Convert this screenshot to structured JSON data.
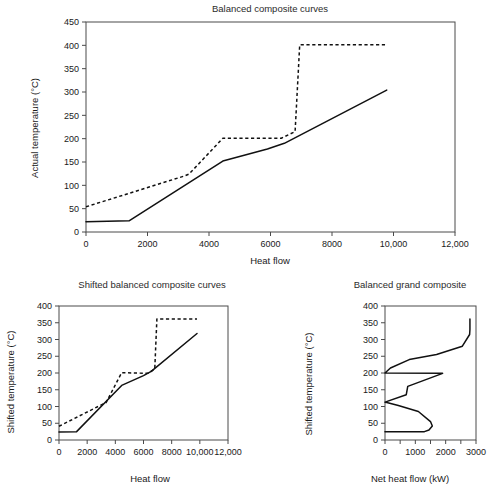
{
  "figure": {
    "background": "#ffffff",
    "line_color": "#111111",
    "axis_color": "#4a4a4a"
  },
  "chart_data": [
    {
      "id": "balanced-composite-curves",
      "type": "line",
      "title": "Balanced composite curves",
      "xlabel": "Heat flow",
      "ylabel": "Actual temperature (°C)",
      "xlim": [
        0,
        12000
      ],
      "ylim": [
        0,
        450
      ],
      "xticks": [
        0,
        2000,
        4000,
        6000,
        8000,
        10000,
        12000
      ],
      "xticklabels": [
        "0",
        "2000",
        "4000",
        "6000",
        "8000",
        "10,000",
        "12,000"
      ],
      "yticks": [
        0,
        50,
        100,
        150,
        200,
        250,
        300,
        350,
        400,
        450
      ],
      "yticklabels": [
        "0",
        "50",
        "100",
        "150",
        "200",
        "250",
        "300",
        "350",
        "400",
        "450"
      ],
      "grid": false,
      "legend": "none",
      "series": [
        {
          "name": "cold composite curve",
          "style": "solid",
          "x": [
            0,
            1400,
            4450,
            5900,
            6450,
            9780
          ],
          "y": [
            22,
            24,
            152,
            178,
            190,
            304
          ]
        },
        {
          "name": "hot composite curve",
          "style": "dashed",
          "x": [
            0,
            3200,
            3350,
            4450,
            6350,
            6800,
            6950,
            9780
          ],
          "y": [
            54,
            120,
            124,
            201,
            201,
            215,
            401,
            401
          ]
        }
      ]
    },
    {
      "id": "shifted-balanced-composite-curves",
      "type": "line",
      "title": "Shifted balanced composite curves",
      "xlabel": "Heat flow",
      "ylabel": "Shifted temperature (°C)",
      "xlim": [
        0,
        12000
      ],
      "ylim": [
        0,
        400
      ],
      "xticks": [
        0,
        2000,
        4000,
        6000,
        8000,
        10000,
        12000
      ],
      "xticklabels": [
        "0",
        "2000",
        "4000",
        "6000",
        "8000",
        "10,000",
        "12,000"
      ],
      "yticks": [
        0,
        50,
        100,
        150,
        200,
        250,
        300,
        350,
        400
      ],
      "yticklabels": [
        "0",
        "50",
        "100",
        "150",
        "200",
        "250",
        "300",
        "350",
        "400"
      ],
      "grid": false,
      "legend": "none",
      "series": [
        {
          "name": "shifted cold composite curve",
          "style": "solid",
          "x": [
            0,
            1250,
            4450,
            6000,
            6550,
            9800
          ],
          "y": [
            24,
            25,
            163,
            192,
            205,
            318
          ]
        },
        {
          "name": "shifted hot composite curve",
          "style": "dashed",
          "x": [
            0,
            3150,
            3350,
            4450,
            6300,
            6800,
            6950,
            9800
          ],
          "y": [
            41,
            108,
            112,
            201,
            199,
            212,
            361,
            361
          ]
        }
      ]
    },
    {
      "id": "balanced-grand-composite",
      "type": "line",
      "title": "Balanced grand composite",
      "xlabel": "Net heat flow (kW)",
      "ylabel": "Shifted temperature (°C)",
      "xlim": [
        0,
        3000
      ],
      "ylim": [
        0,
        400
      ],
      "xticks": [
        0,
        1000,
        2000,
        3000
      ],
      "xticklabels": [
        "0",
        "1000",
        "2000",
        "3000"
      ],
      "xminorticks": [
        500,
        1500,
        2500
      ],
      "yticks": [
        0,
        50,
        100,
        150,
        200,
        250,
        300,
        350,
        400
      ],
      "yticklabels": [
        "0",
        "50",
        "100",
        "150",
        "200",
        "250",
        "300",
        "350",
        "400"
      ],
      "grid": false,
      "legend": "none",
      "orientation": "temperature-on-y",
      "series": [
        {
          "name": "balanced grand composite curve",
          "style": "solid",
          "x": [
            0,
            1300,
            1450,
            1560,
            1500,
            1100,
            440,
            60,
            0,
            700,
            750,
            1900,
            0,
            180,
            800,
            1700,
            2550,
            2790,
            2800,
            2800
          ],
          "y": [
            25,
            25,
            30,
            42,
            55,
            85,
            103,
            112,
            113,
            135,
            160,
            199,
            200,
            215,
            240,
            255,
            280,
            315,
            330,
            361
          ]
        }
      ]
    }
  ]
}
